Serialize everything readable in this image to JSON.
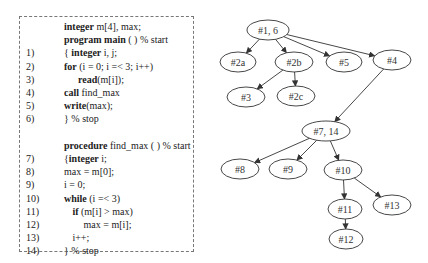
{
  "code": {
    "lines": [
      {
        "num": "",
        "indent": 0,
        "parts": [
          {
            "t": "integer",
            "b": true
          },
          {
            "t": " m[4], max;",
            "b": false
          }
        ]
      },
      {
        "num": "",
        "indent": 0,
        "parts": [
          {
            "t": "program main",
            "b": true
          },
          {
            "t": " ( ) % start",
            "b": false
          }
        ]
      },
      {
        "num": "1)",
        "indent": 0,
        "parts": [
          {
            "t": "{ ",
            "b": false
          },
          {
            "t": "integer",
            "b": true
          },
          {
            "t": " i, j;",
            "b": false
          }
        ]
      },
      {
        "num": "2)",
        "indent": 0,
        "parts": [
          {
            "t": "for",
            "b": true
          },
          {
            "t": " (i = 0; i =< 3; i++)",
            "b": false
          }
        ]
      },
      {
        "num": "3)",
        "indent": 1,
        "parts": [
          {
            "t": "read",
            "b": true
          },
          {
            "t": "(m[i]);",
            "b": false
          }
        ]
      },
      {
        "num": "4)",
        "indent": 0,
        "parts": [
          {
            "t": "call",
            "b": true
          },
          {
            "t": " find_max",
            "b": false
          }
        ]
      },
      {
        "num": "5)",
        "indent": 0,
        "parts": [
          {
            "t": "write",
            "b": true
          },
          {
            "t": "(max);",
            "b": false
          }
        ]
      },
      {
        "num": "6)",
        "indent": 0,
        "parts": [
          {
            "t": "} % stop",
            "b": false
          }
        ]
      },
      {
        "num": "",
        "indent": 0,
        "parts": []
      },
      {
        "num": "",
        "indent": 0,
        "parts": [
          {
            "t": "procedure",
            "b": true
          },
          {
            "t": " find_max ( ) % start",
            "b": false
          }
        ]
      },
      {
        "num": "7)",
        "indent": 0,
        "parts": [
          {
            "t": "{",
            "b": false
          },
          {
            "t": "integer",
            "b": true
          },
          {
            "t": " i;",
            "b": false
          }
        ]
      },
      {
        "num": "8)",
        "indent": 0,
        "parts": [
          {
            "t": "max = m[0];",
            "b": false
          }
        ]
      },
      {
        "num": "9)",
        "indent": 0,
        "parts": [
          {
            "t": "i = 0;",
            "b": false
          }
        ]
      },
      {
        "num": "10)",
        "indent": 0,
        "parts": [
          {
            "t": "while",
            "b": true
          },
          {
            "t": " (i =< 3)",
            "b": false
          }
        ]
      },
      {
        "num": "11)",
        "indent": 0.6,
        "parts": [
          {
            "t": "if",
            "b": true
          },
          {
            "t": " (m[i] > max)",
            "b": false
          }
        ]
      },
      {
        "num": "12)",
        "indent": 1.4,
        "parts": [
          {
            "t": "max = m[i];",
            "b": false
          }
        ]
      },
      {
        "num": "13)",
        "indent": 0.6,
        "parts": [
          {
            "t": "i++;",
            "b": false
          }
        ]
      },
      {
        "num": "14)",
        "indent": 0,
        "parts": [
          {
            "t": "} % stop",
            "b": false
          }
        ]
      }
    ]
  },
  "graph": {
    "nodes": [
      {
        "id": "n1_6",
        "label": "#1, 6",
        "cx": 268,
        "cy": 30,
        "rx": 21,
        "ry": 10
      },
      {
        "id": "n2a",
        "label": "#2a",
        "cx": 238,
        "cy": 62,
        "rx": 18,
        "ry": 10
      },
      {
        "id": "n2b",
        "label": "#2b",
        "cx": 294,
        "cy": 62,
        "rx": 19,
        "ry": 10
      },
      {
        "id": "n5",
        "label": "#5",
        "cx": 344,
        "cy": 62,
        "rx": 18,
        "ry": 10
      },
      {
        "id": "n4",
        "label": "#4",
        "cx": 392,
        "cy": 60,
        "rx": 19,
        "ry": 10
      },
      {
        "id": "n3",
        "label": "#3",
        "cx": 246,
        "cy": 97,
        "rx": 19,
        "ry": 10
      },
      {
        "id": "n2c",
        "label": "#2c",
        "cx": 296,
        "cy": 96,
        "rx": 19,
        "ry": 10
      },
      {
        "id": "n7_14",
        "label": "#7, 14",
        "cx": 326,
        "cy": 131,
        "rx": 24,
        "ry": 10
      },
      {
        "id": "n8",
        "label": "#8",
        "cx": 240,
        "cy": 169,
        "rx": 19,
        "ry": 10
      },
      {
        "id": "n9",
        "label": "#9",
        "cx": 288,
        "cy": 169,
        "rx": 19,
        "ry": 10
      },
      {
        "id": "n10",
        "label": "#10",
        "cx": 343,
        "cy": 170,
        "rx": 19,
        "ry": 10
      },
      {
        "id": "n11",
        "label": "#11",
        "cx": 345,
        "cy": 209,
        "rx": 17,
        "ry": 10
      },
      {
        "id": "n13",
        "label": "#13",
        "cx": 392,
        "cy": 205,
        "rx": 19,
        "ry": 10
      },
      {
        "id": "n12",
        "label": "#12",
        "cx": 346,
        "cy": 239,
        "rx": 17,
        "ry": 10
      }
    ],
    "edges": [
      {
        "from": "n1_6",
        "to": "n2a"
      },
      {
        "from": "n1_6",
        "to": "n2b"
      },
      {
        "from": "n1_6",
        "to": "n5"
      },
      {
        "from": "n1_6",
        "to": "n4"
      },
      {
        "from": "n2b",
        "to": "n3"
      },
      {
        "from": "n2b",
        "to": "n2c"
      },
      {
        "from": "n4",
        "to": "n7_14"
      },
      {
        "from": "n7_14",
        "to": "n8"
      },
      {
        "from": "n7_14",
        "to": "n9"
      },
      {
        "from": "n7_14",
        "to": "n10"
      },
      {
        "from": "n10",
        "to": "n11"
      },
      {
        "from": "n10",
        "to": "n13"
      },
      {
        "from": "n11",
        "to": "n12"
      }
    ]
  }
}
